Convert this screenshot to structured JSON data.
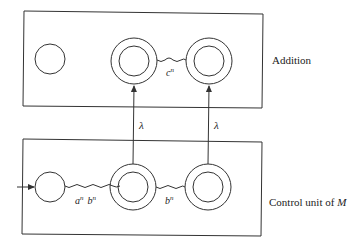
{
  "diagram": {
    "top_box": {
      "label": "Addition",
      "edge_label": "c",
      "edge_label_sup": "n"
    },
    "bottom_box": {
      "label_prefix": "Control unit of ",
      "label_var": "M",
      "edge1_label_a": "a",
      "edge1_label_a_sup": "n",
      "edge1_label_b": "b",
      "edge1_label_b_sup": "n",
      "edge2_label": "b",
      "edge2_label_sup": "n"
    },
    "transitions": [
      {
        "label": "λ"
      },
      {
        "label": "λ"
      }
    ],
    "colors": {
      "stroke": "#333333",
      "text": "#222222",
      "background": "#ffffff"
    }
  }
}
